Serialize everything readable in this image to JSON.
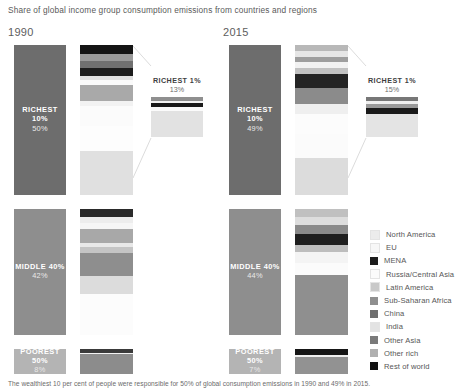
{
  "title": "Share of global income group consumption emissions from countries and regions",
  "caption": "The wealthiest 10 per cent of people were responsible for 50% of global consumption emissions in 1990 and 49% in 2015.",
  "legend": {
    "title": "",
    "items": [
      {
        "label": "North America",
        "color": "#ececec"
      },
      {
        "label": "EU",
        "color": "#f7f7f7"
      },
      {
        "label": "MENA",
        "color": "#1c1c1c"
      },
      {
        "label": "Russia/Central Asia",
        "color": "#fbfbfb"
      },
      {
        "label": "Latin America",
        "color": "#c9c9c9"
      },
      {
        "label": "Sub-Saharan Africa",
        "color": "#8f8f8f"
      },
      {
        "label": "China",
        "color": "#6f6f6f"
      },
      {
        "label": "India",
        "color": "#e3e3e3"
      },
      {
        "label": "Other Asia",
        "color": "#7a7a7a"
      },
      {
        "label": "Other rich",
        "color": "#b0b0b0"
      },
      {
        "label": "Rest of world",
        "color": "#111111"
      }
    ]
  },
  "chart_data": {
    "type": "bar",
    "title": "Share of global income group consumption emissions from countries and regions",
    "xlabel": "",
    "ylabel": "Share of global consumption emissions (%)",
    "grid": false,
    "legend_position": "right",
    "categories": [
      "North America",
      "EU",
      "MENA",
      "Russia/Central Asia",
      "Latin America",
      "Sub-Saharan Africa",
      "China",
      "India",
      "Other Asia",
      "Other rich",
      "Rest of world"
    ],
    "panels": [
      {
        "year": "1990",
        "groups": [
          {
            "name": "RICHEST 10%",
            "value": "50%",
            "share": 50,
            "composition": [
              {
                "region": "Rest of world",
                "share": 3.0,
                "color": "#141414"
              },
              {
                "region": "Other rich",
                "share": 2.2,
                "color": "#9a9a9a"
              },
              {
                "region": "Other Asia",
                "share": 2.4,
                "color": "#707070"
              },
              {
                "region": "MENA",
                "share": 2.6,
                "color": "#1c1c1c"
              },
              {
                "region": "India",
                "share": 1.4,
                "color": "#e0e0e0"
              },
              {
                "region": "Russia/Central Asia",
                "share": 1.6,
                "color": "#fafafa"
              },
              {
                "region": "China",
                "share": 5.4,
                "color": "#a9a9a9"
              },
              {
                "region": "Sub-Saharan Africa",
                "share": 1.6,
                "color": "#f2f2f2"
              },
              {
                "region": "Latin America",
                "share": 6.8,
                "color": "#fbfbfb"
              },
              {
                "region": "EU",
                "share": 8.4,
                "color": "#fdfdfd"
              },
              {
                "region": "North America",
                "share": 14.6,
                "color": "#e0e0e0"
              }
            ]
          },
          {
            "name": "MIDDLE 40%",
            "value": "42%",
            "share": 42,
            "composition": [
              {
                "region": "Rest of world",
                "share": 2.8,
                "color": "#2a2a2a"
              },
              {
                "region": "Other rich",
                "share": 1.8,
                "color": "#ededed"
              },
              {
                "region": "Other Asia",
                "share": 2.2,
                "color": "#f6f6f6"
              },
              {
                "region": "MENA",
                "share": 4.4,
                "color": "#a8a8a8"
              },
              {
                "region": "India",
                "share": 1.6,
                "color": "#e8e8e8"
              },
              {
                "region": "Russia/Central Asia",
                "share": 2.0,
                "color": "#c4c4c4"
              },
              {
                "region": "China",
                "share": 7.6,
                "color": "#8e8e8e"
              },
              {
                "region": "Sub-Saharan Africa",
                "share": 5.8,
                "color": "#dcdcdc"
              },
              {
                "region": "Latin America",
                "share": 13.8,
                "color": "#fcfcfc"
              }
            ]
          },
          {
            "name": "POOREST 50%",
            "value": "8%",
            "share": 8,
            "composition": [
              {
                "region": "Rest of world",
                "share": 1.2,
                "color": "#3a3a3a"
              },
              {
                "region": "Other rich",
                "share": 0.5,
                "color": "#f3f3f3"
              },
              {
                "region": "Other Asia",
                "share": 6.3,
                "color": "#8c8c8c"
              }
            ]
          }
        ],
        "callout": {
          "label": "RICHEST 1%",
          "value": "13%",
          "composition": [
            {
              "region": "Rest of world",
              "share": 1.4,
              "color": "#8f8f8f"
            },
            {
              "region": "Other rich",
              "share": 0.5,
              "color": "#f4f4f4"
            },
            {
              "region": "MENA",
              "share": 1.5,
              "color": "#1a1a1a"
            },
            {
              "region": "Other",
              "share": 1.3,
              "color": "#fbfbfb"
            },
            {
              "region": "North America",
              "share": 8.3,
              "color": "#e2e2e2"
            }
          ]
        }
      },
      {
        "year": "2015",
        "groups": [
          {
            "name": "RICHEST 10%",
            "value": "49%",
            "share": 49,
            "composition": [
              {
                "region": "Rest of world",
                "share": 2.0,
                "color": "#b8b8b8"
              },
              {
                "region": "Other rich",
                "share": 1.8,
                "color": "#e6e6e6"
              },
              {
                "region": "Other Asia",
                "share": 1.6,
                "color": "#9e9e9e"
              },
              {
                "region": "MENA",
                "share": 2.0,
                "color": "#f2f2f2"
              },
              {
                "region": "India",
                "share": 2.2,
                "color": "#c2c2c2"
              },
              {
                "region": "Russia/Central Asia",
                "share": 4.6,
                "color": "#242424"
              },
              {
                "region": "China",
                "share": 5.0,
                "color": "#8b8b8b"
              },
              {
                "region": "Sub-Saharan Africa",
                "share": 3.2,
                "color": "#efefef"
              },
              {
                "region": "Latin America",
                "share": 6.6,
                "color": "#fcfcfc"
              },
              {
                "region": "EU",
                "share": 8.0,
                "color": "#fbfbfb"
              },
              {
                "region": "North America",
                "share": 12.0,
                "color": "#dcdcdc"
              }
            ]
          },
          {
            "name": "MIDDLE 40%",
            "value": "44%",
            "share": 44,
            "composition": [
              {
                "region": "Rest of world",
                "share": 2.4,
                "color": "#c0c0c0"
              },
              {
                "region": "Other rich",
                "share": 2.4,
                "color": "#dddddd"
              },
              {
                "region": "Other Asia",
                "share": 2.6,
                "color": "#8a8a8a"
              },
              {
                "region": "MENA",
                "share": 3.2,
                "color": "#1e1e1e"
              },
              {
                "region": "India",
                "share": 2.2,
                "color": "#bdbdbd"
              },
              {
                "region": "Russia/Central Asia",
                "share": 3.4,
                "color": "#f4f4f4"
              },
              {
                "region": "Sub-Saharan Africa",
                "share": 3.4,
                "color": "#fbfbfb"
              },
              {
                "region": "China",
                "share": 18.0,
                "color": "#8f8f8f"
              }
            ]
          },
          {
            "name": "POOREST 50%",
            "value": "7%",
            "share": 7,
            "composition": [
              {
                "region": "Rest of world",
                "share": 1.6,
                "color": "#161616"
              },
              {
                "region": "Other rich",
                "share": 0.6,
                "color": "#f0f0f0"
              },
              {
                "region": "Other Asia",
                "share": 4.8,
                "color": "#929292"
              }
            ]
          }
        ],
        "callout": {
          "label": "RICHEST 1%",
          "value": "15%",
          "composition": [
            {
              "region": "Rest of world",
              "share": 1.6,
              "color": "#777777"
            },
            {
              "region": "Other rich",
              "share": 1.0,
              "color": "#efefef"
            },
            {
              "region": "Russia/Central Asia",
              "share": 1.4,
              "color": "#9a9a9a"
            },
            {
              "region": "MENA",
              "share": 2.2,
              "color": "#1a1a1a"
            },
            {
              "region": "North America",
              "share": 8.8,
              "color": "#e4e4e4"
            }
          ]
        }
      }
    ]
  }
}
